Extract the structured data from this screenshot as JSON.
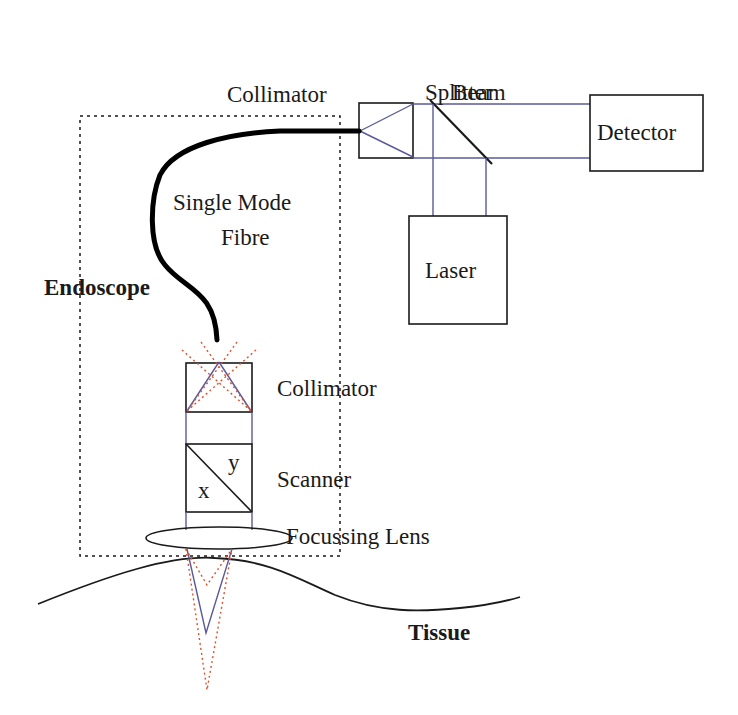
{
  "diagram": {
    "labels": {
      "beam": "Beam",
      "splitter": "Splitter",
      "collimator_top": "Collimator",
      "detector": "Detector",
      "laser": "Laser",
      "single_mode": "Single Mode",
      "fibre": "Fibre",
      "endoscope": "Endoscope",
      "collimator_bottom": "Collimator",
      "scanner": "Scanner",
      "scanner_x": "x",
      "scanner_y": "y",
      "focussing_lens": "Focussing Lens",
      "tissue": "Tissue"
    },
    "colors": {
      "beam_path": "#5a5a9a",
      "scan_path": "#e0502a",
      "outline": "#1a1a1a"
    }
  }
}
